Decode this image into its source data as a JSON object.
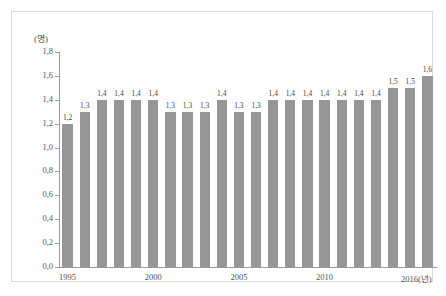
{
  "figure": {
    "unit_label": "(명)",
    "bar_color": "#969696",
    "axis_color": "#9b9b9b",
    "frame_color": "#d8d8d8"
  },
  "chart_data": {
    "type": "bar",
    "title": "",
    "subtitle": "",
    "xlabel": "",
    "ylabel": "(명)",
    "unit": "명",
    "grid": false,
    "legend": "none",
    "ylim": [
      0.0,
      1.8
    ],
    "ytick_step": 0.2,
    "decimal_separator": ",",
    "ytick_labels": [
      "0,0",
      "0,2",
      "0,4",
      "0,6",
      "0,8",
      "1,0",
      "1,2",
      "1,4",
      "1,6",
      "1,8"
    ],
    "ytick_values": [
      0.0,
      0.2,
      0.4,
      0.6,
      0.8,
      1.0,
      1.2,
      1.4,
      1.6,
      1.8
    ],
    "xtick_labels": [
      "1995",
      "2000",
      "2005",
      "2010",
      "2016(년)"
    ],
    "xtick_categories": [
      "1995",
      "2000",
      "2005",
      "2010",
      "2016"
    ],
    "categories": [
      "1995",
      "1996",
      "1997",
      "1998",
      "1999",
      "2000",
      "2001",
      "2002",
      "2003",
      "2004",
      "2005",
      "2006",
      "2007",
      "2008",
      "2009",
      "2010",
      "2011",
      "2012",
      "2013",
      "2014",
      "2015",
      "2016"
    ],
    "values": [
      1.2,
      1.3,
      1.4,
      1.4,
      1.4,
      1.4,
      1.3,
      1.3,
      1.3,
      1.4,
      1.3,
      1.3,
      1.4,
      1.4,
      1.4,
      1.4,
      1.4,
      1.4,
      1.4,
      1.5,
      1.5,
      1.6
    ],
    "value_labels": [
      "1,2",
      "1,3",
      "1,4",
      "1,4",
      "1,4",
      "1,4",
      "1,3",
      "1,3",
      "1,3",
      "1,4",
      "1,3",
      "1,3",
      "1,4",
      "1,4",
      "1,4",
      "1,4",
      "1,4",
      "1,4",
      "1,4",
      "1,5",
      "1,5",
      "1,6"
    ]
  }
}
